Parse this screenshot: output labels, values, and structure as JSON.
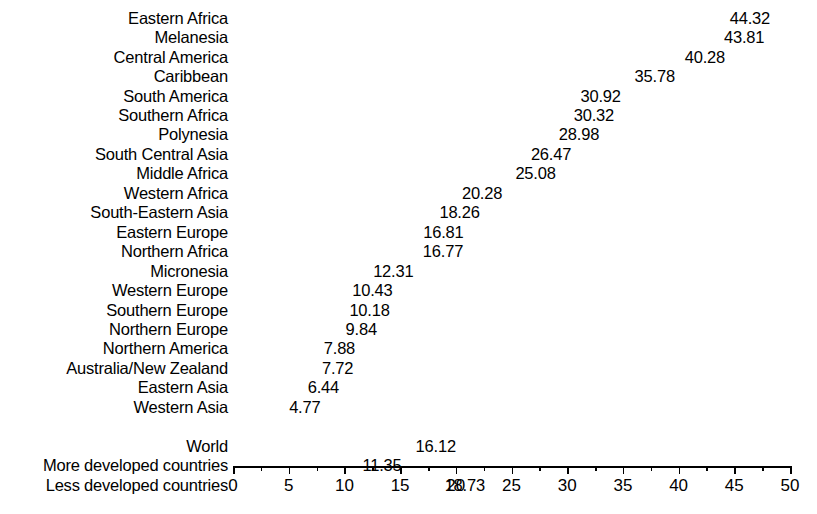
{
  "chart_data": {
    "type": "bar",
    "orientation": "horizontal",
    "title": "",
    "subtitle": "",
    "xlabel": "",
    "ylabel": "",
    "xlim": [
      0,
      50
    ],
    "grid": false,
    "legend": null,
    "axis": {
      "major_ticks": [
        0,
        5,
        10,
        15,
        20,
        25,
        30,
        35,
        40,
        45,
        50
      ],
      "minor_ticks": [
        2.5,
        7.5,
        12.5,
        17.5,
        22.5,
        27.5,
        32.5,
        37.5,
        42.5,
        47.5
      ],
      "tick_labels": [
        "0",
        "5",
        "10",
        "15",
        "20",
        "25",
        "30",
        "35",
        "40",
        "45",
        "50"
      ]
    },
    "bar_color": "#0d0d0d",
    "groups": [
      {
        "name": "regions",
        "categories": [
          "Eastern Africa",
          "Melanesia",
          "Central America",
          "Caribbean",
          "South America",
          "Southern Africa",
          "Polynesia",
          "South Central Asia",
          "Middle Africa",
          "Western Africa",
          "South-Eastern Asia",
          "Eastern Europe",
          "Northern Africa",
          "Micronesia",
          "Western Europe",
          "Southern Europe",
          "Northern Europe",
          "Northern America",
          "Australia/New Zealand",
          "Eastern Asia",
          "Western Asia"
        ],
        "values": [
          44.32,
          43.81,
          40.28,
          35.78,
          30.92,
          30.32,
          28.98,
          26.47,
          25.08,
          20.28,
          18.26,
          16.81,
          16.77,
          12.31,
          10.43,
          10.18,
          9.84,
          7.88,
          7.72,
          6.44,
          4.77
        ],
        "value_labels": [
          "44.32",
          "43.81",
          "40.28",
          "35.78",
          "30.92",
          "30.32",
          "28.98",
          "26.47",
          "25.08",
          "20.28",
          "18.26",
          "16.81",
          "16.77",
          "12.31",
          "10.43",
          "10.18",
          "9.84",
          "7.88",
          "7.72",
          "6.44",
          "4.77"
        ]
      },
      {
        "name": "aggregates",
        "categories": [
          "World",
          "More developed countries",
          "Less developed countries"
        ],
        "values": [
          16.12,
          11.35,
          18.73
        ],
        "value_labels": [
          "16.12",
          "11.35",
          "18.73"
        ]
      }
    ]
  }
}
